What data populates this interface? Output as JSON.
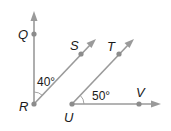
{
  "diagram": {
    "type": "geometry-angles",
    "points": {
      "Q": "Q",
      "R": "R",
      "S": "S",
      "T": "T",
      "U": "U",
      "V": "V"
    },
    "angles": {
      "QRS": "40°",
      "TUV": "50°"
    },
    "rays": [
      "RQ",
      "RS",
      "UT",
      "UV"
    ],
    "colors": {
      "line": "#9a9a9a",
      "point": "#8c8c8c",
      "text": "#1a1a1a"
    }
  }
}
